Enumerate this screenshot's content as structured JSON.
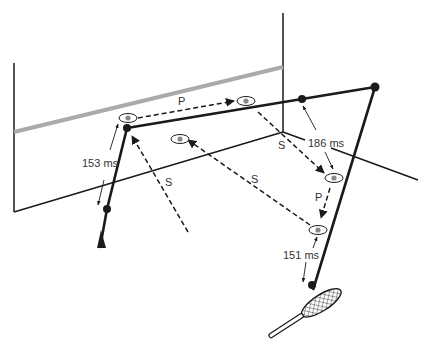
{
  "diagram": {
    "colors": {
      "ink": "#1a1a1a",
      "wall_stripe": "#aaaaaa",
      "eye_iris": "#888888",
      "background": "#ffffff"
    },
    "labels": {
      "p_top": "P",
      "p_right": "P",
      "s_left": "S",
      "s_middle": "S",
      "s_corner": "S",
      "t_153": "153 ms",
      "t_186": "186 ms",
      "t_151": "151 ms"
    },
    "legend_semantics": {
      "P": "pursuit eye movement",
      "S": "saccade"
    },
    "icons": [
      "eye-icon",
      "racket-icon",
      "ball-bounce-dot",
      "arrowhead"
    ]
  }
}
